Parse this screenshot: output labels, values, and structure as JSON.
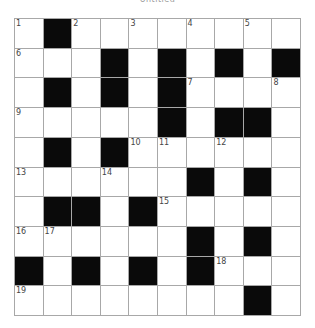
{
  "title": "Untitled",
  "grid": {
    "rows": 10,
    "cols": 10,
    "colors": {
      "black": "#0a0a0a",
      "white": "#ffffff",
      "line": "#a8a8a8",
      "number": "#444444"
    },
    "cells": [
      [
        "1",
        "#",
        "2",
        "",
        "3",
        "",
        "4",
        "",
        "5",
        ""
      ],
      [
        "6",
        "",
        "",
        "#",
        "",
        "#",
        "",
        "#",
        "",
        "#"
      ],
      [
        "",
        "#",
        "",
        "#",
        "",
        "#",
        "7",
        "",
        "",
        "8"
      ],
      [
        "9",
        "",
        "",
        "",
        "",
        "#",
        "",
        "#",
        "#",
        ""
      ],
      [
        "",
        "#",
        "",
        "#",
        "10",
        "11",
        "",
        "12",
        "",
        ""
      ],
      [
        "13",
        "",
        "",
        "14",
        "",
        "",
        "#",
        "",
        "#",
        ""
      ],
      [
        "",
        "#",
        "#",
        "",
        "#",
        "15",
        "",
        "",
        "",
        ""
      ],
      [
        "16",
        "17",
        "",
        "",
        "",
        "",
        "#",
        "",
        "#",
        ""
      ],
      [
        "#",
        "",
        "#",
        "",
        "#",
        "",
        "#",
        "18",
        "",
        ""
      ],
      [
        "19",
        "",
        "",
        "",
        "",
        "",
        "",
        "",
        "#",
        ""
      ]
    ]
  }
}
